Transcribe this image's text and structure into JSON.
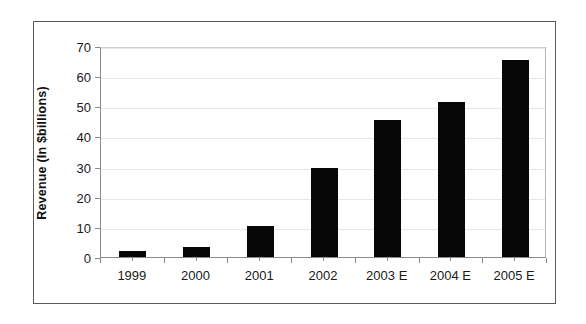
{
  "chart_data": {
    "type": "bar",
    "title": "",
    "xlabel": "",
    "ylabel": "Revenue (In $billions)",
    "categories": [
      "1999",
      "2000",
      "2001",
      "2002",
      "2003 E",
      "2004 E",
      "2005 E"
    ],
    "values": [
      2,
      3.2,
      10.3,
      29.4,
      45.5,
      51.5,
      65.5
    ],
    "ylim": [
      0,
      70
    ],
    "ytick_labels": [
      "0",
      "10",
      "20",
      "30",
      "40",
      "50",
      "60",
      "70"
    ],
    "ytick_values": [
      0,
      10,
      20,
      30,
      40,
      50,
      60,
      70
    ],
    "grid": true,
    "legend": false,
    "bar_color": "#070707",
    "grid_color": "#e6e6e6",
    "axis_color": "#8a8a8a",
    "frame_color": "#5a5a5a",
    "background": "#ffffff"
  }
}
